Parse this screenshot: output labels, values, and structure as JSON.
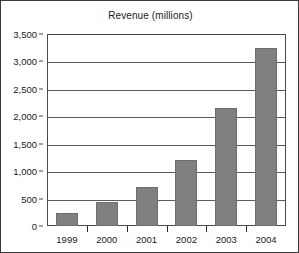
{
  "chart_data": {
    "type": "bar",
    "title": "Revenue (millions)",
    "xlabel": "",
    "ylabel": "",
    "categories": [
      "1999",
      "2000",
      "2001",
      "2002",
      "2003",
      "2004"
    ],
    "values": [
      230,
      430,
      720,
      1200,
      2150,
      3250
    ],
    "ylim": [
      0,
      3500
    ],
    "ytick_values": [
      0,
      500,
      1000,
      1500,
      2000,
      2500,
      3000,
      3500
    ],
    "ytick_labels": [
      "0",
      "500",
      "1,000",
      "1,500",
      "2,000",
      "2,500",
      "3,000",
      "3,500"
    ],
    "grid": true,
    "legend": false,
    "legend_position": "none",
    "series": [
      {
        "name": "Revenue",
        "values": [
          230,
          430,
          720,
          1200,
          2150,
          3250
        ]
      }
    ]
  },
  "colors": {
    "bar_fill": "#808080",
    "bar_stroke": "#6e6e6e",
    "gridline": "#5a5a5a",
    "axis": "#4a4a4a",
    "text": "#1a1a1a",
    "plot_background": "#ffffff",
    "page_background": "#ffffff",
    "page_border": "#3a3a3a"
  }
}
